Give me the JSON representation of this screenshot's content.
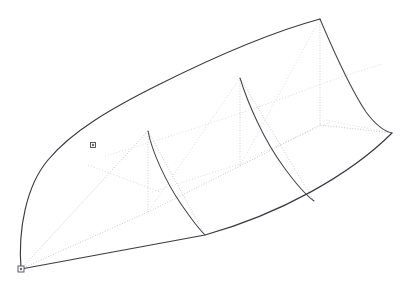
{
  "view": {
    "title": "3D Surface Wireframe Viewport",
    "width": 415,
    "height": 290,
    "background_color": "#ffffff",
    "outline_color": "#3a3a42",
    "rib_color": "#45454d",
    "isoline_color": "#b8b8bf",
    "isoline_faint_color": "#cfcfd6",
    "marker_fill_color": "#ffffff",
    "marker_stroke_color": "#4a4a52",
    "marker_core_color": "#6d6d76"
  },
  "geometry": {
    "description": "Lofted NURBS surface shown as wireframe with rib cross-sections, dotted isoparametric lines and two square control point handles",
    "boundary": {
      "top_rail": "M 21,269 C 18,230 26,186 48,160 C 72,131 112,108 158,85 C 212,58 272,32 320,19",
      "bottom_rail": "M 21,269 L 205,235 C 280,214 350,175 392,133",
      "right_cap_upper": "M 320,19 C 340,40 358,70 366,98 C 374,120 382,130 392,133",
      "left_cap": "M 21,269 C 18,230 26,186 48,160"
    },
    "ribs": [
      {
        "name": "rib-1",
        "path": "M 148,131 C 152,152 166,182 181,204 C 192,220 200,230 205,235"
      },
      {
        "name": "rib-2",
        "path": "M 240,78 C 248,104 264,140 283,166 C 296,184 307,196 314,201"
      },
      {
        "name": "rib-3",
        "path": "M 320,19 C 331,45 348,85 366,112 C 378,128 387,132 392,133"
      }
    ],
    "isolines_vertical": [
      {
        "name": "iso-vert-1",
        "path": "M 148,131 L 148,212"
      },
      {
        "name": "iso-vert-2",
        "path": "M 240,78 L 240,166"
      },
      {
        "name": "iso-vert-3",
        "path": "M 320,19 L 320,125"
      }
    ],
    "isolines_diagonal": [
      {
        "name": "iso-diag-lower-1",
        "path": "M 21,269 L 148,212"
      },
      {
        "name": "iso-diag-lower-2",
        "path": "M 148,212 L 240,166"
      },
      {
        "name": "iso-diag-lower-3",
        "path": "M 240,166 L 320,125"
      },
      {
        "name": "iso-diag-lower-4",
        "path": "M 320,125 L 392,133"
      },
      {
        "name": "iso-diag-cross-1",
        "path": "M 21,269 L 148,131"
      },
      {
        "name": "iso-diag-cross-2",
        "path": "M 60,195 L 148,212"
      },
      {
        "name": "iso-diag-cross-3",
        "path": "M 148,131 L 205,235"
      },
      {
        "name": "iso-diag-cross-4",
        "path": "M 240,78 L 314,201"
      },
      {
        "name": "iso-diag-mid-rail",
        "path": "M 105,156 C 160,140 235,116 300,92 C 340,77 368,68 382,64"
      },
      {
        "name": "iso-diag-hatch-1",
        "path": "M 88,165 L 160,192"
      },
      {
        "name": "iso-diag-hatch-2",
        "path": "M 152,192 L 252,160"
      },
      {
        "name": "iso-diag-hatch-3",
        "path": "M 250,158 L 330,122"
      },
      {
        "name": "iso-diag-hatch-4",
        "path": "M 326,120 L 392,133"
      },
      {
        "name": "iso-diag-upper-1",
        "path": "M 148,212 L 240,78"
      },
      {
        "name": "iso-diag-upper-2",
        "path": "M 240,166 L 320,19"
      }
    ],
    "control_points": [
      {
        "name": "control-point-left-edge",
        "x": 93,
        "y": 145,
        "size": 5
      },
      {
        "name": "control-point-origin",
        "x": 21,
        "y": 269,
        "size": 6
      }
    ]
  }
}
